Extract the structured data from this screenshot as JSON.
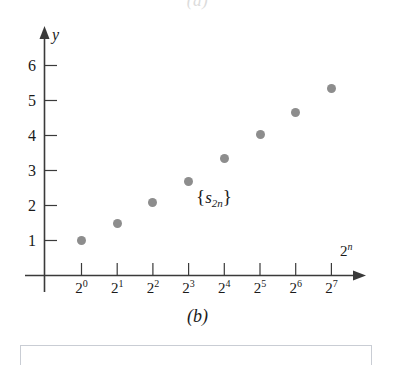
{
  "figure": {
    "caption_top": "(a)",
    "caption_bottom": "(b)",
    "series_label_open": "{",
    "series_label_symbol": "s",
    "series_label_sub": "2n",
    "series_label_close": "}"
  },
  "axes": {
    "y_name": "y",
    "x_name_base": "2",
    "x_name_exp": "n"
  },
  "chart_data": {
    "type": "scatter",
    "title": "",
    "subtitle": "",
    "xlabel": "2^n",
    "ylabel": "y",
    "grid": false,
    "legend": "inline-annotation",
    "annotations": [
      {
        "text": "{s_2n}",
        "x_index": 4,
        "y": 2.1
      },
      {
        "text": "(b)",
        "position": "below-axis-center"
      }
    ],
    "x_tick_labels": [
      "2⁰",
      "2¹",
      "2²",
      "2³",
      "2⁴",
      "2⁵",
      "2⁶",
      "2⁷"
    ],
    "x_tick_bases": [
      "2",
      "2",
      "2",
      "2",
      "2",
      "2",
      "2",
      "2"
    ],
    "x_tick_exponents": [
      "0",
      "1",
      "2",
      "3",
      "4",
      "5",
      "6",
      "7"
    ],
    "y_tick_labels": [
      "1",
      "2",
      "3",
      "4",
      "5",
      "6"
    ],
    "ylim": [
      0,
      6.6
    ],
    "series": [
      {
        "name": "{s_2n}",
        "color": "#8d8d8d",
        "x": [
          1,
          2,
          4,
          8,
          16,
          32,
          64,
          128
        ],
        "x_labels": [
          "2⁰",
          "2¹",
          "2²",
          "2³",
          "2⁴",
          "2⁵",
          "2⁶",
          "2⁷"
        ],
        "values": [
          1.0,
          1.5,
          2.08,
          2.68,
          3.35,
          4.03,
          4.67,
          5.35
        ]
      }
    ]
  },
  "colors": {
    "point": "#8d8d8d",
    "axis": "#3a3a3a",
    "text": "#1a1a1a",
    "box_border": "#c9cdd4",
    "ghost_text": "#dcdcdc"
  }
}
